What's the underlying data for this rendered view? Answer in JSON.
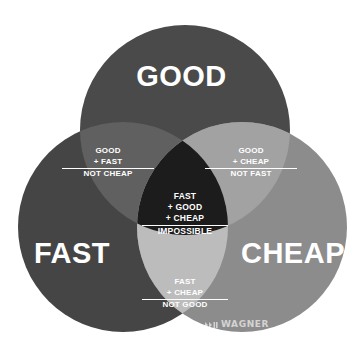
{
  "diagram": {
    "type": "venn",
    "set_count": 3,
    "background_color": "#ffffff",
    "sets": [
      {
        "id": "good",
        "label": "GOOD",
        "color": "#4a4a4a",
        "position": "top",
        "center": {
          "x": 185,
          "y": 130
        },
        "radius": 105
      },
      {
        "id": "fast",
        "label": "FAST",
        "color": "#454545",
        "position": "bottom-left",
        "center": {
          "x": 123,
          "y": 227
        },
        "radius": 105
      },
      {
        "id": "cheap",
        "label": "CHEAP",
        "color": "#8c8c8c",
        "position": "bottom-right",
        "center": {
          "x": 242,
          "y": 227
        },
        "radius": 105
      }
    ],
    "intersections": [
      {
        "id": "good-fast",
        "sets": [
          "good",
          "fast"
        ],
        "color": "#606060",
        "lines": [
          "GOOD",
          "+ FAST",
          "NOT CHEAP"
        ],
        "ruled_line_index": 2
      },
      {
        "id": "good-cheap",
        "sets": [
          "good",
          "cheap"
        ],
        "color": "#a2a2a2",
        "lines": [
          "GOOD",
          "+ CHEAP",
          "NOT FAST"
        ],
        "ruled_line_index": 2
      },
      {
        "id": "fast-cheap",
        "sets": [
          "fast",
          "cheap"
        ],
        "color": "#bcbcbc",
        "lines": [
          "FAST",
          "+ CHEAP",
          "NOT GOOD"
        ],
        "ruled_line_index": 2
      },
      {
        "id": "good-fast-cheap",
        "sets": [
          "good",
          "fast",
          "cheap"
        ],
        "color": "#1c1c1c",
        "lines": [
          "FAST",
          "+ GOOD",
          "+ CHEAP",
          "IMPOSSIBLE"
        ],
        "ruled_line_index": 3
      }
    ]
  },
  "brand": {
    "wordmark": "WAGNER",
    "mark_icon": "chevrons-icon",
    "mark_color": "#ffffff"
  }
}
